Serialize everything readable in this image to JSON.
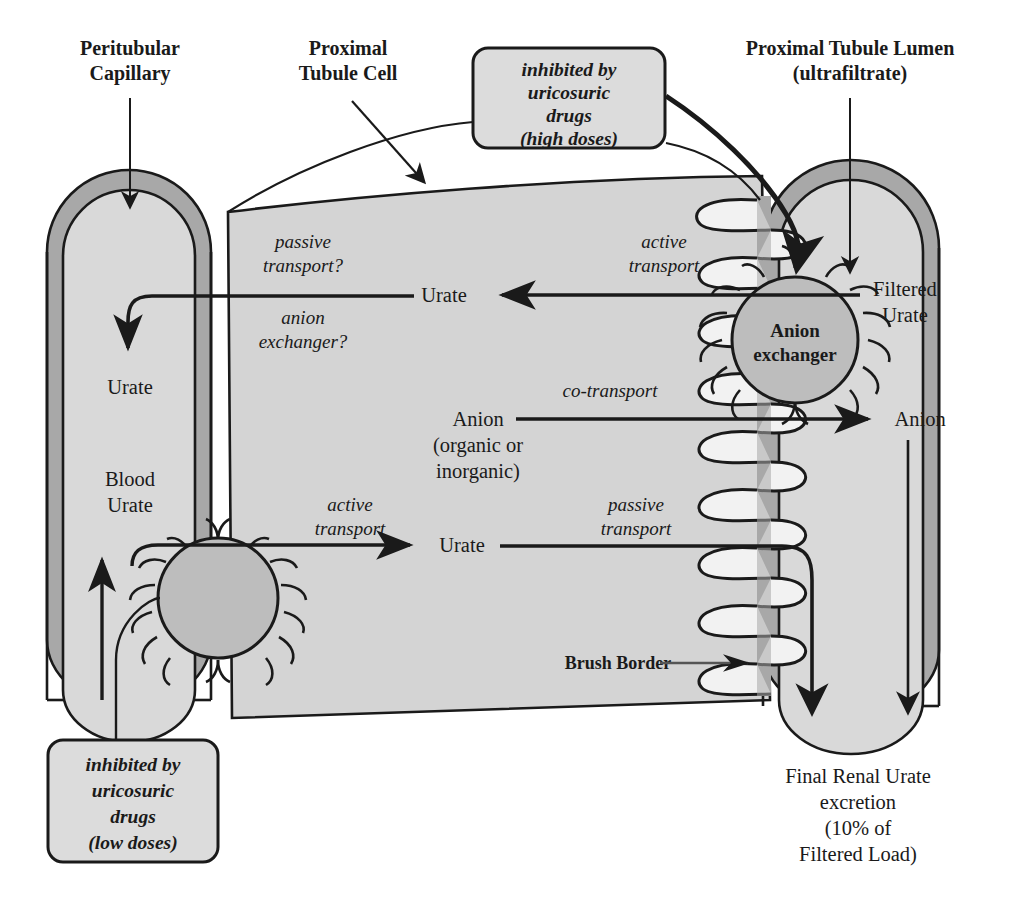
{
  "figure": {
    "type": "diagram"
  },
  "colors": {
    "wall_gray": "#a8a8a8",
    "lumen_fill": "#d9d9d9",
    "cell_fill": "#d4d4d4",
    "circle_fill": "#bdbdbd",
    "box_fill": "#dcdcdc",
    "villi_fill": "#f2f2f2",
    "stroke": "#1a1a1a"
  },
  "headers": {
    "peritubular_capillary": [
      "Peritubular",
      "Capillary"
    ],
    "proximal_tubule_cell": [
      "Proximal",
      "Tubule Cell"
    ],
    "proximal_tubule_lumen": [
      "Proximal Tubule Lumen",
      "(ultrafiltrate)"
    ]
  },
  "callout_boxes": [
    {
      "id": "high-doses",
      "lines": [
        "inhibited by",
        "uricosuric",
        "drugs",
        "(high doses)"
      ]
    },
    {
      "id": "low-doses",
      "lines": [
        "inhibited by",
        "uricosuric",
        "drugs",
        "(low doses)"
      ]
    }
  ],
  "transport_labels": [
    {
      "id": "passive-transport-q",
      "lines": [
        "passive",
        "transport?"
      ]
    },
    {
      "id": "anion-exchanger-q",
      "lines": [
        "anion",
        "exchanger?"
      ]
    },
    {
      "id": "active-transport-top",
      "lines": [
        "active",
        "transport"
      ]
    },
    {
      "id": "co-transport",
      "lines": [
        "co-transport"
      ]
    },
    {
      "id": "active-transport-bottom",
      "lines": [
        "active",
        "transport"
      ]
    },
    {
      "id": "passive-transport-bottom",
      "lines": [
        "passive",
        "transport"
      ]
    }
  ],
  "species_labels": [
    {
      "id": "urate-capillary",
      "lines": [
        "Urate"
      ]
    },
    {
      "id": "urate-cell-top",
      "lines": [
        "Urate"
      ]
    },
    {
      "id": "filtered-urate",
      "lines": [
        "Filtered",
        "Urate"
      ]
    },
    {
      "id": "anion-cell",
      "lines": [
        "Anion",
        "(organic or",
        "inorganic)"
      ]
    },
    {
      "id": "anion-lumen",
      "lines": [
        "Anion"
      ]
    },
    {
      "id": "blood-urate",
      "lines": [
        "Blood",
        "Urate"
      ]
    },
    {
      "id": "urate-cell-bottom",
      "lines": [
        "Urate"
      ]
    }
  ],
  "annotations": {
    "brush_border": "Brush Border",
    "anion_exchanger_circle": [
      "Anion",
      "exchanger"
    ],
    "final_excretion": [
      "Final Renal Urate",
      "excretion",
      "(10% of",
      "Filtered Load)"
    ]
  }
}
